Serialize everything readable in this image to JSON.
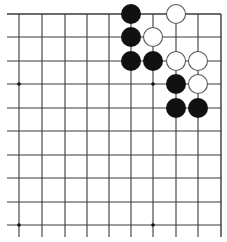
{
  "diagram": {
    "type": "go-board-fragment",
    "corner": "top-right",
    "colors": {
      "background": "#ffffff",
      "line": "#3a3a3a",
      "black_stone": "#111111",
      "white_stone": "#ffffff",
      "white_stone_edge": "#555555",
      "star_point": "#111111"
    },
    "grid": {
      "x": [
        19,
        42,
        65,
        87,
        109,
        131,
        153,
        176,
        198,
        221
      ],
      "y": [
        14,
        37,
        61,
        84,
        108,
        131,
        155,
        178,
        202,
        225
      ],
      "h_line_x_range": [
        7,
        221
      ],
      "v_line_y_range": [
        14,
        237
      ]
    },
    "star_points": [
      {
        "col": 0,
        "row": 3
      },
      {
        "col": 6,
        "row": 3
      },
      {
        "col": 0,
        "row": 9
      },
      {
        "col": 6,
        "row": 9
      }
    ],
    "stone_radius": 10,
    "stones": [
      {
        "color": "black",
        "col": 5,
        "row": 0
      },
      {
        "color": "white",
        "col": 7,
        "row": 0
      },
      {
        "color": "black",
        "col": 5,
        "row": 1
      },
      {
        "color": "white",
        "col": 6,
        "row": 1
      },
      {
        "color": "black",
        "col": 5,
        "row": 2
      },
      {
        "color": "black",
        "col": 6,
        "row": 2
      },
      {
        "color": "white",
        "col": 7,
        "row": 2
      },
      {
        "color": "white",
        "col": 8,
        "row": 2
      },
      {
        "color": "black",
        "col": 7,
        "row": 3
      },
      {
        "color": "white",
        "col": 8,
        "row": 3
      },
      {
        "color": "black",
        "col": 7,
        "row": 4
      },
      {
        "color": "black",
        "col": 8,
        "row": 4
      }
    ]
  }
}
